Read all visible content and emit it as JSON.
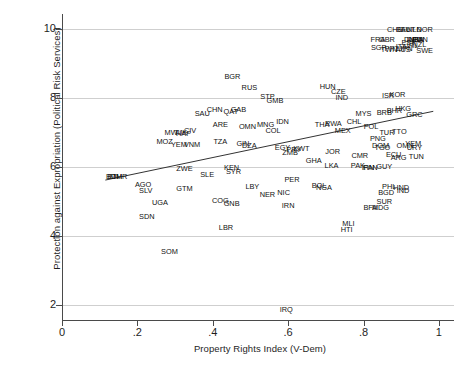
{
  "chart_data": {
    "type": "scatter",
    "title": "",
    "xlabel": "Property Rights Index (V-Dem)",
    "ylabel": "Protection against Expropriation (Political Risk Services)",
    "xlim": [
      0,
      1.04
    ],
    "ylim": [
      1.55,
      10.45
    ],
    "xticks": [
      0,
      0.2,
      0.4,
      0.6,
      0.8,
      1
    ],
    "xtick_labels": [
      "0",
      ".2",
      ".4",
      ".6",
      ".8",
      "1"
    ],
    "yticks": [
      2,
      4,
      6,
      8,
      10
    ],
    "ytick_labels": [
      "2",
      "4",
      "6",
      "8",
      "10"
    ],
    "grid": "horizontal",
    "legend": "none",
    "marker_style": "country-code-text-labels",
    "fit_line": {
      "type": "linear",
      "x": [
        0.115,
        0.985
      ],
      "y": [
        5.62,
        7.62
      ]
    },
    "points": [
      {
        "label": "BGR",
        "x": 0.452,
        "y": 8.62
      },
      {
        "label": "RUS",
        "x": 0.497,
        "y": 8.3
      },
      {
        "label": "HUN",
        "x": 0.705,
        "y": 8.32
      },
      {
        "label": "CZE",
        "x": 0.733,
        "y": 8.19
      },
      {
        "label": "CHE",
        "x": 0.883,
        "y": 9.98
      },
      {
        "label": "BEL",
        "x": 0.905,
        "y": 9.98
      },
      {
        "label": "AUT",
        "x": 0.918,
        "y": 9.98
      },
      {
        "label": "NLD",
        "x": 0.935,
        "y": 9.98
      },
      {
        "label": "NOR",
        "x": 0.962,
        "y": 9.98
      },
      {
        "label": "FRA",
        "x": 0.838,
        "y": 9.7
      },
      {
        "label": "GBR",
        "x": 0.862,
        "y": 9.7
      },
      {
        "label": "DNK",
        "x": 0.928,
        "y": 9.68
      },
      {
        "label": "FIN",
        "x": 0.945,
        "y": 9.68
      },
      {
        "label": "DEU",
        "x": 0.935,
        "y": 9.68
      },
      {
        "label": "CAN",
        "x": 0.95,
        "y": 9.68
      },
      {
        "label": "USA",
        "x": 0.94,
        "y": 9.68
      },
      {
        "label": "SGP",
        "x": 0.84,
        "y": 9.45
      },
      {
        "label": "PRT",
        "x": 0.875,
        "y": 9.42
      },
      {
        "label": "TWN",
        "x": 0.868,
        "y": 9.4
      },
      {
        "label": "ITA",
        "x": 0.9,
        "y": 9.48
      },
      {
        "label": "AUS",
        "x": 0.905,
        "y": 9.4
      },
      {
        "label": "JPN",
        "x": 0.912,
        "y": 9.42
      },
      {
        "label": "SWE",
        "x": 0.962,
        "y": 9.38
      },
      {
        "label": "IRL",
        "x": 0.93,
        "y": 9.52
      },
      {
        "label": "NZL",
        "x": 0.948,
        "y": 9.55
      },
      {
        "label": "ESP",
        "x": 0.92,
        "y": 9.62
      },
      {
        "label": "STP",
        "x": 0.545,
        "y": 8.05
      },
      {
        "label": "GMB",
        "x": 0.565,
        "y": 7.92
      },
      {
        "label": "IND",
        "x": 0.742,
        "y": 8.02
      },
      {
        "label": "ISR",
        "x": 0.865,
        "y": 8.07
      },
      {
        "label": "KOR",
        "x": 0.89,
        "y": 8.1
      },
      {
        "label": "SAU",
        "x": 0.372,
        "y": 7.55
      },
      {
        "label": "CHN",
        "x": 0.405,
        "y": 7.66
      },
      {
        "label": "QAT",
        "x": 0.448,
        "y": 7.6
      },
      {
        "label": "GAB",
        "x": 0.468,
        "y": 7.66
      },
      {
        "label": "MYS",
        "x": 0.8,
        "y": 7.55
      },
      {
        "label": "BRB",
        "x": 0.855,
        "y": 7.57
      },
      {
        "label": "BHR",
        "x": 0.882,
        "y": 7.62
      },
      {
        "label": "HKG",
        "x": 0.905,
        "y": 7.7
      },
      {
        "label": "GRC",
        "x": 0.935,
        "y": 7.5
      },
      {
        "label": "ARE",
        "x": 0.42,
        "y": 7.22
      },
      {
        "label": "OMN",
        "x": 0.492,
        "y": 7.17
      },
      {
        "label": "MNG",
        "x": 0.54,
        "y": 7.22
      },
      {
        "label": "IDN",
        "x": 0.585,
        "y": 7.3
      },
      {
        "label": "THA",
        "x": 0.69,
        "y": 7.22
      },
      {
        "label": "RWA",
        "x": 0.72,
        "y": 7.26
      },
      {
        "label": "CHL",
        "x": 0.775,
        "y": 7.3
      },
      {
        "label": "POL",
        "x": 0.82,
        "y": 7.15
      },
      {
        "label": "MEX",
        "x": 0.745,
        "y": 7.05
      },
      {
        "label": "TUR",
        "x": 0.862,
        "y": 7.0
      },
      {
        "label": "TTO",
        "x": 0.895,
        "y": 7.02
      },
      {
        "label": "MWI",
        "x": 0.292,
        "y": 7.0
      },
      {
        "label": "TJK",
        "x": 0.315,
        "y": 7.0
      },
      {
        "label": "CIV",
        "x": 0.34,
        "y": 7.05
      },
      {
        "label": "HAF",
        "x": 0.322,
        "y": 6.95
      },
      {
        "label": "MOZ",
        "x": 0.272,
        "y": 6.72
      },
      {
        "label": "YEM",
        "x": 0.31,
        "y": 6.65
      },
      {
        "label": "VNM",
        "x": 0.345,
        "y": 6.65
      },
      {
        "label": "TZA",
        "x": 0.42,
        "y": 6.72
      },
      {
        "label": "GIN",
        "x": 0.48,
        "y": 6.68
      },
      {
        "label": "DZA",
        "x": 0.497,
        "y": 6.62
      },
      {
        "label": "EGY",
        "x": 0.585,
        "y": 6.55
      },
      {
        "label": "PRY",
        "x": 0.615,
        "y": 6.5
      },
      {
        "label": "KWT",
        "x": 0.635,
        "y": 6.53
      },
      {
        "label": "COL",
        "x": 0.56,
        "y": 7.05
      },
      {
        "label": "ZMB",
        "x": 0.605,
        "y": 6.42
      },
      {
        "label": "PNG",
        "x": 0.838,
        "y": 6.8
      },
      {
        "label": "DOM",
        "x": 0.845,
        "y": 6.62
      },
      {
        "label": "TGO",
        "x": 0.85,
        "y": 6.55
      },
      {
        "label": "OMN2",
        "x": 0.91,
        "y": 6.62
      },
      {
        "label": "YEM2",
        "x": 0.932,
        "y": 6.66
      },
      {
        "label": "URY",
        "x": 0.935,
        "y": 6.55
      },
      {
        "label": "JOR",
        "x": 0.718,
        "y": 6.45
      },
      {
        "label": "CMR",
        "x": 0.79,
        "y": 6.32
      },
      {
        "label": "ECU",
        "x": 0.88,
        "y": 6.35
      },
      {
        "label": "ARG",
        "x": 0.893,
        "y": 6.26
      },
      {
        "label": "TUN",
        "x": 0.94,
        "y": 6.3
      },
      {
        "label": "GHA",
        "x": 0.668,
        "y": 6.18
      },
      {
        "label": "ZWE",
        "x": 0.325,
        "y": 5.95
      },
      {
        "label": "KEN",
        "x": 0.45,
        "y": 5.98
      },
      {
        "label": "SYR",
        "x": 0.455,
        "y": 5.86
      },
      {
        "label": "SLE",
        "x": 0.385,
        "y": 5.78
      },
      {
        "label": "LKA",
        "x": 0.715,
        "y": 6.02
      },
      {
        "label": "PAK",
        "x": 0.785,
        "y": 6.02
      },
      {
        "label": "PAN",
        "x": 0.818,
        "y": 5.98
      },
      {
        "label": "IRN2",
        "x": 0.812,
        "y": 5.96
      },
      {
        "label": "GUY",
        "x": 0.855,
        "y": 6.0
      },
      {
        "label": "MMR",
        "x": 0.15,
        "y": 5.72
      },
      {
        "label": "ETH",
        "x": 0.14,
        "y": 5.72
      },
      {
        "label": "BDI",
        "x": 0.133,
        "y": 5.72
      },
      {
        "label": "AGO",
        "x": 0.215,
        "y": 5.48
      },
      {
        "label": "SLV",
        "x": 0.222,
        "y": 5.3
      },
      {
        "label": "GTM",
        "x": 0.325,
        "y": 5.35
      },
      {
        "label": "LBY",
        "x": 0.505,
        "y": 5.42
      },
      {
        "label": "PER",
        "x": 0.61,
        "y": 5.62
      },
      {
        "label": "BOL",
        "x": 0.682,
        "y": 5.45
      },
      {
        "label": "NGA",
        "x": 0.695,
        "y": 5.38
      },
      {
        "label": "NIC",
        "x": 0.588,
        "y": 5.25
      },
      {
        "label": "NER",
        "x": 0.545,
        "y": 5.18
      },
      {
        "label": "PHL",
        "x": 0.868,
        "y": 5.42
      },
      {
        "label": "HND",
        "x": 0.9,
        "y": 5.38
      },
      {
        "label": "BGD",
        "x": 0.86,
        "y": 5.25
      },
      {
        "label": "IND2",
        "x": 0.905,
        "y": 5.3
      },
      {
        "label": "UGA",
        "x": 0.26,
        "y": 4.95
      },
      {
        "label": "COG",
        "x": 0.42,
        "y": 5.02
      },
      {
        "label": "GNB",
        "x": 0.45,
        "y": 4.92
      },
      {
        "label": "IRN",
        "x": 0.6,
        "y": 4.88
      },
      {
        "label": "SUR",
        "x": 0.855,
        "y": 4.98
      },
      {
        "label": "BFA",
        "x": 0.818,
        "y": 4.82
      },
      {
        "label": "MDG",
        "x": 0.845,
        "y": 4.82
      },
      {
        "label": "SDN",
        "x": 0.225,
        "y": 4.55
      },
      {
        "label": "MLI",
        "x": 0.76,
        "y": 4.35
      },
      {
        "label": "LBR",
        "x": 0.435,
        "y": 4.22
      },
      {
        "label": "HTI",
        "x": 0.755,
        "y": 4.18
      },
      {
        "label": "SOM",
        "x": 0.285,
        "y": 3.52
      },
      {
        "label": "IRQ",
        "x": 0.595,
        "y": 1.85
      }
    ]
  },
  "axis": {
    "xlabel": "Property Rights Index (V-Dem)",
    "ylabel": "Protection against Expropriation (Political Risk Services)"
  }
}
